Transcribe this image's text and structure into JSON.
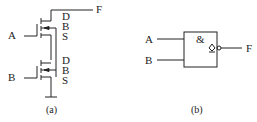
{
  "figure_a": {
    "caption": "(a)",
    "output_label": "F",
    "inputs": [
      "A",
      "B"
    ],
    "transistor_top": {
      "d": "D",
      "b": "B",
      "s": "S"
    },
    "transistor_bottom": {
      "d": "D",
      "b": "B",
      "s": "S"
    }
  },
  "figure_b": {
    "caption": "(b)",
    "gate_symbol": "&",
    "output_marker": "open-drain",
    "inputs": [
      "A",
      "B"
    ],
    "output_label": "F"
  },
  "colors": {
    "line": "#222222",
    "background": "#ffffff"
  }
}
